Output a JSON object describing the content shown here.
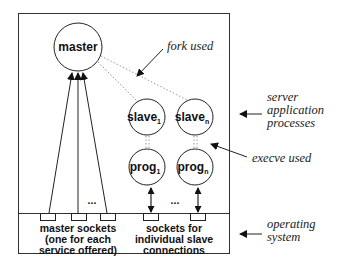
{
  "diagram": {
    "nodes": {
      "master": {
        "label": "master"
      },
      "slave1": {
        "label": "slave",
        "sub": "1"
      },
      "slaven": {
        "label": "slave",
        "sub": "n"
      },
      "prog1": {
        "label": "prog",
        "sub": "1"
      },
      "progn": {
        "label": "prog",
        "sub": "n"
      }
    },
    "ellipsis": "...",
    "socket_labels": {
      "master": [
        "master sockets",
        "(one for each",
        "service offered)"
      ],
      "slave": [
        "sockets for",
        "individual slave",
        "connections"
      ]
    },
    "annotations": {
      "fork": "fork used",
      "server": [
        "server",
        "application",
        "processes"
      ],
      "execve": "execve used",
      "os": [
        "operating",
        "system"
      ]
    },
    "colors": {
      "line": "#222222",
      "dotted": "#9a9a9a"
    }
  }
}
